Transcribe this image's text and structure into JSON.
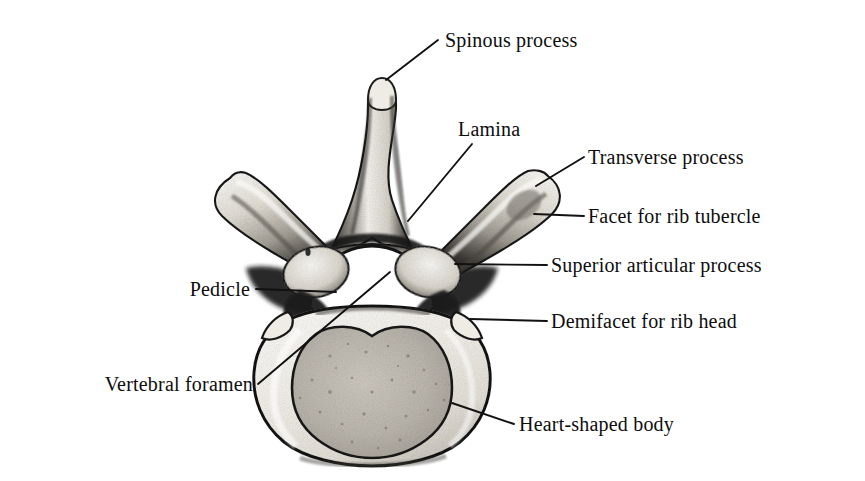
{
  "figure": {
    "view": "superior",
    "background_color": "#ffffff",
    "ink_color": "#111111",
    "bone_light_color": "#f2efe9",
    "bone_mid_color": "#c9c4bb",
    "bone_dark_color": "#1a1a1a",
    "cancellous_color": "#b9b4ab"
  },
  "labels": [
    {
      "id": "spinous-process",
      "text": "Spinous process",
      "text_x": 445,
      "text_y": 47,
      "anchor": "start",
      "leader": [
        [
          438,
          40
        ],
        [
          386,
          80
        ]
      ]
    },
    {
      "id": "lamina",
      "text": "Lamina",
      "text_x": 458,
      "text_y": 136,
      "anchor": "start",
      "leader": [
        [
          472,
          144
        ],
        [
          408,
          221
        ]
      ]
    },
    {
      "id": "transverse-process",
      "text": "Transverse process",
      "text_x": 588,
      "text_y": 164,
      "anchor": "start",
      "leader": [
        [
          584,
          157
        ],
        [
          536,
          186
        ]
      ]
    },
    {
      "id": "facet-for-rib-tubercle",
      "text": "Facet for rib tubercle",
      "text_x": 588,
      "text_y": 223,
      "anchor": "start",
      "leader": [
        [
          584,
          216
        ],
        [
          534,
          214
        ]
      ]
    },
    {
      "id": "superior-articular-process",
      "text": "Superior articular process",
      "text_x": 551,
      "text_y": 272,
      "anchor": "start",
      "leader": [
        [
          547,
          265
        ],
        [
          455,
          264
        ]
      ]
    },
    {
      "id": "demifacet-for-rib-head",
      "text": "Demifacet for rib head",
      "text_x": 551,
      "text_y": 328,
      "anchor": "start",
      "leader": [
        [
          547,
          321
        ],
        [
          470,
          319
        ]
      ]
    },
    {
      "id": "heart-shaped-body",
      "text": "Heart-shaped body",
      "text_x": 519,
      "text_y": 431,
      "anchor": "start",
      "leader": [
        [
          514,
          424
        ],
        [
          452,
          403
        ]
      ]
    },
    {
      "id": "pedicle",
      "text": "Pedicle",
      "text_x": 250,
      "text_y": 296,
      "anchor": "end",
      "leader": [
        [
          256,
          289
        ],
        [
          336,
          292
        ]
      ]
    },
    {
      "id": "vertebral-foramen",
      "text": "Vertebral foramen",
      "text_x": 253,
      "text_y": 391,
      "anchor": "end",
      "leader": [
        [
          258,
          384
        ],
        [
          390,
          272
        ]
      ]
    }
  ]
}
